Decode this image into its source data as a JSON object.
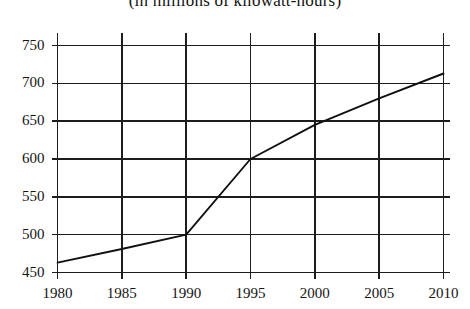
{
  "chart_data": {
    "type": "line",
    "title": "(in millions of kilowatt-hours)",
    "xlabel": "",
    "ylabel": "",
    "x": [
      1980,
      1985,
      1990,
      1995,
      2000,
      2005,
      2010
    ],
    "values": [
      463,
      481,
      500,
      600,
      645,
      680,
      713
    ],
    "series": [
      {
        "name": "",
        "values": [
          463,
          481,
          500,
          600,
          645,
          680,
          713
        ]
      }
    ],
    "xlim": [
      1980,
      2010
    ],
    "ylim": [
      450,
      750
    ],
    "xticks": [
      1980,
      1985,
      1990,
      1995,
      2000,
      2005,
      2010
    ],
    "yticks": [
      450,
      500,
      550,
      600,
      650,
      700,
      750
    ],
    "xtick_labels": [
      "1980",
      "1985",
      "1990",
      "1995",
      "2000",
      "2005",
      "2010"
    ],
    "ytick_labels": [
      "450",
      "500",
      "550",
      "600",
      "650",
      "700",
      "750"
    ],
    "grid": true,
    "legend": false,
    "line_color": "#111111",
    "grid_color": "#1d1d1d",
    "background_color": "#ffffff"
  }
}
